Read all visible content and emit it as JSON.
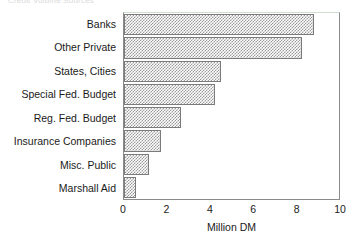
{
  "caption": {
    "cut_off_text": "Credit Volume Sources"
  },
  "chart_data": {
    "type": "bar",
    "orientation": "horizontal",
    "title": "",
    "xlabel": "Million DM",
    "ylabel": "",
    "xlim": [
      0,
      10
    ],
    "ylim": null,
    "grid": false,
    "legend": null,
    "xticks": [
      "0",
      "2",
      "4",
      "6",
      "8",
      "10"
    ],
    "xtick_values": [
      0,
      2,
      4,
      6,
      8,
      10
    ],
    "categories": [
      "Banks",
      "Other Private",
      "States, Cities",
      "Special Fed. Budget",
      "Reg. Fed. Budget",
      "Insurance Companies",
      "Misc. Public",
      "Marshall Aid"
    ],
    "values": [
      8.85,
      8.3,
      4.5,
      4.25,
      2.65,
      1.7,
      1.15,
      0.55
    ],
    "series": [
      {
        "name": "Million DM",
        "values": [
          8.85,
          8.3,
          4.5,
          4.25,
          2.65,
          1.7,
          1.15,
          0.55
        ]
      }
    ],
    "bar_fill": "checkerboard-hatch",
    "bar_edge_color": "#7b7b7b",
    "axis_color": "#8a8a8a",
    "background_color": "#ffffff"
  }
}
